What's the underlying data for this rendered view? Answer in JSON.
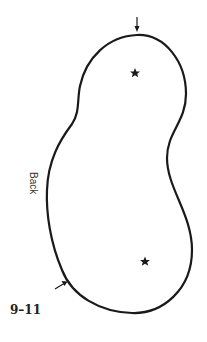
{
  "diagram": {
    "figure_label": "9–11",
    "side_label": "Back",
    "colors": {
      "stroke": "#1a1a1a",
      "background": "#ffffff"
    },
    "markers": [
      {
        "type": "star",
        "name": "upper-star"
      },
      {
        "type": "star",
        "name": "lower-star"
      }
    ],
    "arrows": [
      {
        "name": "top-arrow",
        "direction": "down"
      },
      {
        "name": "lower-left-arrow",
        "direction": "up-right"
      }
    ]
  }
}
